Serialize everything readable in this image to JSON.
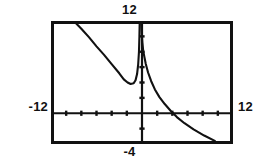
{
  "figure": {
    "kind": "graphing-calculator-screen"
  },
  "labels": {
    "ymax": "12",
    "ymin": "-4",
    "xmin": "-12",
    "xmax": "12"
  },
  "colors": {
    "ink": "#111111",
    "screen_background": "#ffffff"
  },
  "chart_data": {
    "type": "line",
    "title": "",
    "xlabel": "",
    "ylabel": "",
    "xlim": [
      -12,
      12
    ],
    "ylim": [
      -4,
      12
    ],
    "grid": false,
    "legend": null,
    "annotations": [
      {
        "text": "12",
        "position": "top",
        "meaning": "Ymax"
      },
      {
        "text": "-4",
        "position": "bottom",
        "meaning": "Ymin"
      },
      {
        "text": "-12",
        "position": "left",
        "meaning": "Xmin"
      },
      {
        "text": "12",
        "position": "right",
        "meaning": "Xmax"
      }
    ],
    "axes": {
      "x_axis_y_value": 0,
      "y_axis_x_value": 0,
      "x_tick_spacing": 2,
      "y_tick_spacing": 2,
      "x_ticks": [
        -12,
        -10,
        -8,
        -6,
        -4,
        -2,
        0,
        2,
        4,
        6,
        8,
        10,
        12
      ],
      "y_ticks": [
        -4,
        -2,
        0,
        2,
        4,
        6,
        8,
        10,
        12
      ]
    },
    "series": [
      {
        "name": "branch-left",
        "comment": "descending curve entering top-left, dipping to a local minimum, then rising to the vertical asymptote",
        "points": [
          [
            -9.0,
            12.0
          ],
          [
            -8.0,
            11.0
          ],
          [
            -7.0,
            9.9
          ],
          [
            -6.0,
            8.7
          ],
          [
            -5.0,
            7.6
          ],
          [
            -4.0,
            6.4
          ],
          [
            -3.0,
            5.2
          ],
          [
            -2.4,
            4.4
          ],
          [
            -1.9,
            4.0
          ],
          [
            -1.5,
            3.8
          ],
          [
            -1.1,
            3.9
          ],
          [
            -0.85,
            4.3
          ],
          [
            -0.65,
            5.1
          ],
          [
            -0.5,
            6.4
          ],
          [
            -0.4,
            8.0
          ],
          [
            -0.34,
            10.0
          ],
          [
            -0.3,
            12.0
          ]
        ]
      },
      {
        "name": "branch-right",
        "comment": "branch falling from the top of the screen beside the asymptote, decaying toward the x-axis then continuing down as a line to the lower right",
        "points": [
          [
            -0.12,
            12.0
          ],
          [
            -0.05,
            10.6
          ],
          [
            0.05,
            9.2
          ],
          [
            0.15,
            8.2
          ],
          [
            0.3,
            7.4
          ],
          [
            0.5,
            6.4
          ],
          [
            0.8,
            5.3
          ],
          [
            1.2,
            4.2
          ],
          [
            1.7,
            3.1
          ],
          [
            2.3,
            2.1
          ],
          [
            3.0,
            1.2
          ],
          [
            3.8,
            0.3
          ],
          [
            4.6,
            -0.5
          ],
          [
            5.6,
            -1.3
          ],
          [
            6.8,
            -2.1
          ],
          [
            8.2,
            -2.9
          ],
          [
            9.6,
            -3.6
          ]
        ]
      }
    ]
  }
}
